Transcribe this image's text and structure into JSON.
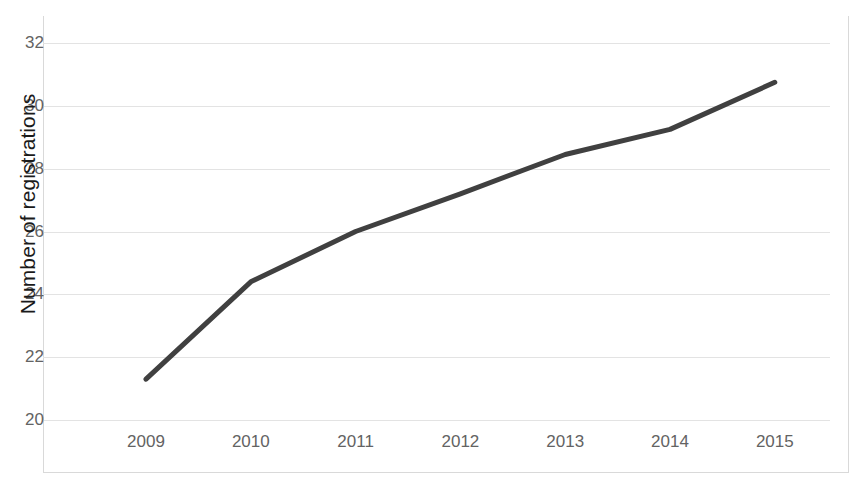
{
  "chart_data": {
    "type": "line",
    "title": "",
    "xlabel": "",
    "ylabel": "Number of registrations",
    "categories": [
      "2009",
      "2010",
      "2011",
      "2012",
      "2013",
      "2014",
      "2015"
    ],
    "x": [
      2009,
      2010,
      2011,
      2012,
      2013,
      2014,
      2015
    ],
    "values": [
      21.3,
      24.4,
      26.0,
      27.2,
      28.45,
      29.25,
      30.75
    ],
    "series": [
      {
        "name": "Number of registrations",
        "values": [
          21.3,
          24.4,
          26.0,
          27.2,
          28.45,
          29.25,
          30.75
        ]
      }
    ],
    "ylim": [
      20,
      32
    ],
    "yticks": [
      20,
      22,
      24,
      26,
      28,
      30,
      32
    ],
    "ytick_labels": [
      "20",
      "22",
      "24",
      "26",
      "28",
      "30",
      "32"
    ],
    "xtick_labels": [
      "2009",
      "2010",
      "2011",
      "2012",
      "2013",
      "2014",
      "2015"
    ],
    "grid": "horizontal",
    "legend": "none",
    "line_color": "#404040",
    "gridline_color": "#E3E3E3",
    "tick_label_color": "#636363",
    "axis_title_color": "#1A1A1A",
    "background_color": "#FFFFFF",
    "line_width": 5,
    "markers": "none"
  }
}
